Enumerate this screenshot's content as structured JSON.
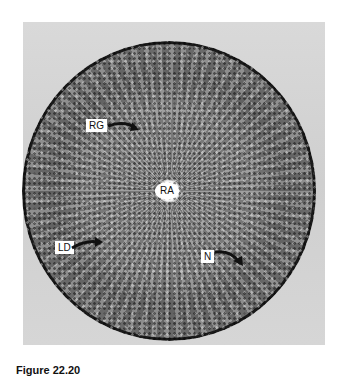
{
  "figure": {
    "caption": "Figure 22.20",
    "labels": {
      "rg": "RG",
      "ra": "RA",
      "ld": "LD",
      "n": "N"
    }
  }
}
